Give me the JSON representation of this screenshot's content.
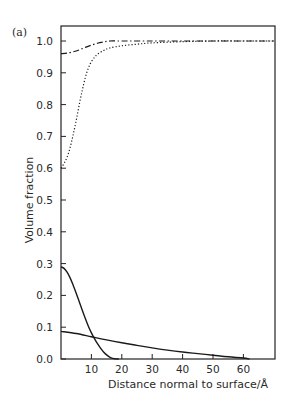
{
  "panel_label": "(a)",
  "chart_data": {
    "type": "line",
    "title": "",
    "xlabel": "Distance normal to surface/Å",
    "ylabel": "Volume fraction",
    "xlim": [
      0,
      70
    ],
    "ylim": [
      0,
      1.03
    ],
    "xticks": [
      10,
      20,
      30,
      40,
      50,
      60
    ],
    "xtick_labels": [
      "10",
      "20",
      "30",
      "40",
      "50",
      "60"
    ],
    "yticks": [
      0.0,
      0.1,
      0.2,
      0.3,
      0.4,
      0.5,
      0.6,
      0.7,
      0.8,
      0.9,
      1.0
    ],
    "ytick_labels": [
      "0.0",
      "0.1",
      "0.2",
      "0.3",
      "0.4",
      "0.5",
      "0.6",
      "0.7",
      "0.8",
      "0.9",
      "1.0"
    ],
    "grid": false,
    "legend": null,
    "series": [
      {
        "name": "dash-dot curve",
        "style": "dashdot",
        "x": [
          0,
          2,
          4,
          6,
          8,
          10,
          12,
          14,
          16,
          20,
          30,
          40,
          50,
          60,
          70
        ],
        "y": [
          0.96,
          0.962,
          0.966,
          0.972,
          0.98,
          0.987,
          0.993,
          0.997,
          1.0,
          1.0,
          1.0,
          1.0,
          1.0,
          1.0,
          1.0
        ]
      },
      {
        "name": "dotted curve",
        "style": "dotted",
        "x": [
          0,
          1,
          2,
          3,
          4,
          5,
          6,
          7,
          8,
          9,
          10,
          11,
          12,
          14,
          16,
          20,
          25,
          30,
          40,
          50,
          60,
          70
        ],
        "y": [
          0.6,
          0.615,
          0.635,
          0.665,
          0.705,
          0.75,
          0.8,
          0.845,
          0.885,
          0.915,
          0.935,
          0.948,
          0.958,
          0.97,
          0.978,
          0.985,
          0.99,
          0.994,
          0.998,
          1.0,
          1.0,
          1.0
        ]
      },
      {
        "name": "solid steep curve",
        "style": "solid",
        "x": [
          0,
          1,
          2,
          3,
          4,
          5,
          6,
          7,
          8,
          9,
          10,
          11,
          12,
          13,
          14,
          15,
          16,
          17,
          18,
          19
        ],
        "y": [
          0.29,
          0.285,
          0.273,
          0.255,
          0.232,
          0.207,
          0.18,
          0.153,
          0.127,
          0.103,
          0.082,
          0.064,
          0.048,
          0.034,
          0.022,
          0.013,
          0.006,
          0.002,
          0.0005,
          0.0
        ]
      },
      {
        "name": "solid shallow curve",
        "style": "solid",
        "x": [
          0,
          5,
          10,
          15,
          20,
          25,
          30,
          35,
          40,
          45,
          50,
          55,
          60,
          62
        ],
        "y": [
          0.087,
          0.08,
          0.07,
          0.06,
          0.051,
          0.043,
          0.035,
          0.028,
          0.022,
          0.017,
          0.012,
          0.007,
          0.003,
          0.0
        ]
      }
    ]
  }
}
